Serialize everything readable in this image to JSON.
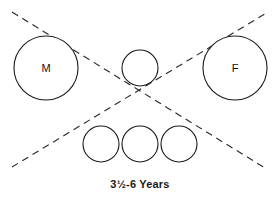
{
  "diagram": {
    "caption": "3½-6 Years",
    "background_color": "#ffffff",
    "stroke_color": "#1a1a1a",
    "dash_color": "#2b2b2b",
    "nodes": [
      {
        "id": "male-parent",
        "label": "M",
        "cx": 46,
        "cy": 68,
        "r": 32
      },
      {
        "id": "female-parent",
        "label": "F",
        "cx": 235,
        "cy": 68,
        "r": 32
      },
      {
        "id": "child-top-center",
        "label": "",
        "cx": 140,
        "cy": 68,
        "r": 18
      },
      {
        "id": "child-bottom-left",
        "label": "",
        "cx": 101,
        "cy": 144,
        "r": 18
      },
      {
        "id": "child-bottom-mid",
        "label": "",
        "cx": 140,
        "cy": 144,
        "r": 18
      },
      {
        "id": "child-bottom-right",
        "label": "",
        "cx": 179,
        "cy": 144,
        "r": 18
      }
    ],
    "cross_lines": [
      {
        "id": "dashed-line-down-right",
        "x1": 12,
        "y1": 12,
        "x2": 265,
        "y2": 168
      },
      {
        "id": "dashed-line-up-right",
        "x1": 12,
        "y1": 167,
        "x2": 268,
        "y2": 12
      }
    ]
  }
}
